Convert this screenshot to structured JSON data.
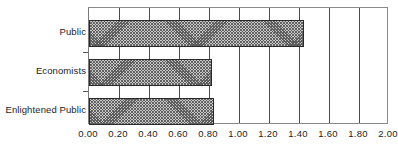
{
  "chart_data": {
    "type": "bar",
    "orientation": "horizontal",
    "title": "",
    "xlabel": "",
    "ylabel": "",
    "categories": [
      "Public",
      "Economists",
      "Enlightened Public"
    ],
    "values": [
      1.43,
      0.82,
      0.83
    ],
    "series": [
      {
        "name": "",
        "values": [
          1.43,
          0.82,
          0.83
        ]
      }
    ],
    "xlim": [
      0.0,
      2.0
    ],
    "xticks": [
      0.0,
      0.2,
      0.4,
      0.6,
      0.8,
      1.0,
      1.2,
      1.4,
      1.6,
      1.8,
      2.0
    ],
    "xtick_labels": [
      "0.00",
      "0.20",
      "0.40",
      "0.60",
      "0.80",
      "1.00",
      "1.20",
      "1.40",
      "1.60",
      "1.80",
      "2.00"
    ],
    "grid": "vertical",
    "legend": "none",
    "bar_fill": "#c9c9c9",
    "bar_pattern": "crosshatch",
    "bar_border": "#2a2a2a",
    "gridline_color": "#4b4b4b",
    "frame_color": "#8a8a8a",
    "background": "#ffffff"
  }
}
